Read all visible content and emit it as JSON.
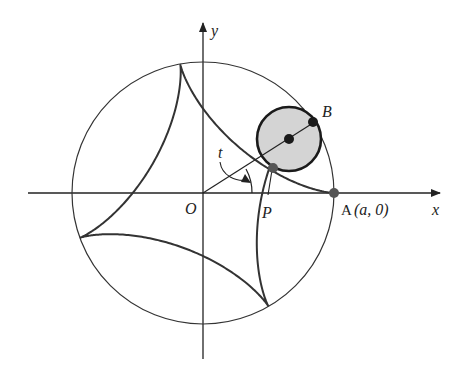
{
  "diagram": {
    "type": "hypocycloid-construction",
    "origin_px": [
      203,
      193
    ],
    "big_circle_radius_px": 131,
    "rolling_circle": {
      "center_px": [
        289,
        139
      ],
      "radius_px": 32,
      "fill": "#d4d4d4"
    },
    "cusp_spacing_deg": 100,
    "arcs_drawn": 4,
    "partial_arc_deg": 22,
    "curve_color": "#333333",
    "axis_color": "#222222",
    "point_color": "#1a1a1a",
    "p_point_color": "#555555"
  },
  "labels": {
    "y_axis": "y",
    "x_axis": "x",
    "origin": "O",
    "point_p": "P",
    "point_a": "A",
    "point_a_coords": "(a, 0)",
    "point_b": "B",
    "angle": "t"
  }
}
